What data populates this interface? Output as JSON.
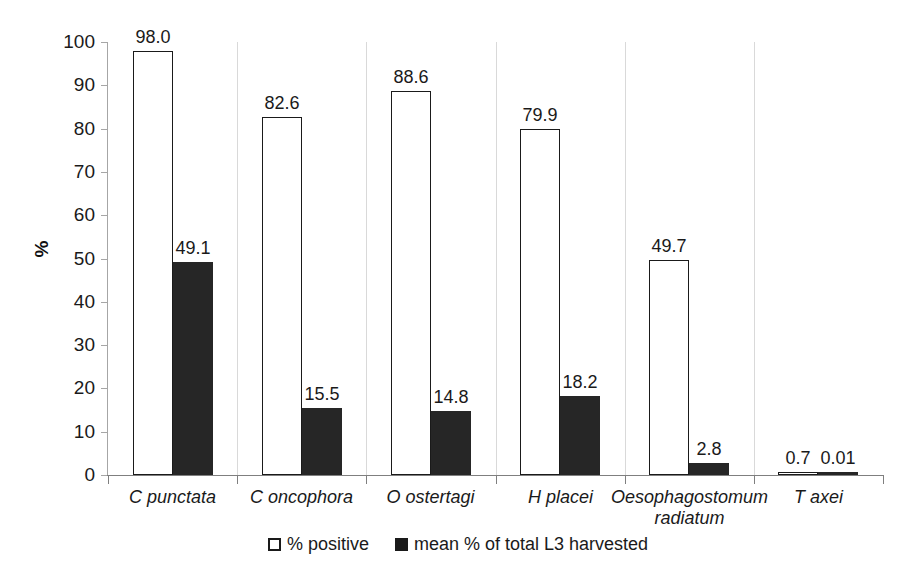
{
  "chart_data": {
    "type": "bar",
    "title": "",
    "subtitle": "",
    "xlabel": "",
    "ylabel": "%",
    "ylim": [
      0,
      100
    ],
    "ytick_step": 10,
    "yticks": [
      "100",
      "90",
      "80",
      "70",
      "60",
      "50",
      "40",
      "30",
      "20",
      "10",
      "0"
    ],
    "grid": false,
    "legend_position": "bottom",
    "categories": [
      "C punctata",
      "C oncophora",
      "O ostertagi",
      "H placei",
      "Oesophagostomum radiatum",
      "T axei"
    ],
    "category_lines": [
      [
        "C punctata"
      ],
      [
        "C oncophora"
      ],
      [
        "O ostertagi"
      ],
      [
        "H placei"
      ],
      [
        "Oesophagostomum",
        "radiatum"
      ],
      [
        "T axei"
      ]
    ],
    "series": [
      {
        "name": "% positive",
        "style": "open",
        "values": [
          98.0,
          82.6,
          88.6,
          79.9,
          49.7,
          0.7
        ],
        "labels": [
          "98.0",
          "82.6",
          "88.6",
          "79.9",
          "49.7",
          "0.7"
        ]
      },
      {
        "name": "mean % of total L3 harvested",
        "style": "filled",
        "values": [
          49.1,
          15.5,
          14.8,
          18.2,
          2.8,
          0.01
        ],
        "labels": [
          "49.1",
          "15.5",
          "14.8",
          "18.2",
          "2.8",
          "0.01"
        ]
      }
    ]
  },
  "legend": {
    "items": [
      {
        "label": "% positive",
        "marker": "open-square-icon"
      },
      {
        "label": "mean % of total L3 harvested",
        "marker": "filled-square-icon"
      }
    ]
  },
  "colors": {
    "open_bar_fill": "#ffffff",
    "open_bar_stroke": "#1a1a1a",
    "filled_bar": "#262626",
    "axis": "#7f7f7f",
    "text": "#1a1a1a",
    "background": "#ffffff"
  }
}
